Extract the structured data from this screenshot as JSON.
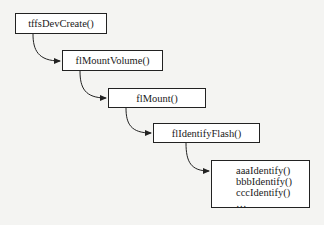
{
  "diagram": {
    "nodes": [
      {
        "id": "n1",
        "label": "tffsDevCreate()"
      },
      {
        "id": "n2",
        "label": "flMountVolume()"
      },
      {
        "id": "n3",
        "label": "flMount()"
      },
      {
        "id": "n4",
        "label": "flIdentifyFlash()"
      },
      {
        "id": "n5",
        "items": [
          "aaaIdentify()",
          "bbbIdentify()",
          "cccIdentify()",
          "…"
        ]
      }
    ],
    "edges": [
      {
        "from": "n1",
        "to": "n2"
      },
      {
        "from": "n2",
        "to": "n3"
      },
      {
        "from": "n3",
        "to": "n4"
      },
      {
        "from": "n4",
        "to": "n5"
      }
    ],
    "colors": {
      "stroke": "#222222",
      "background": "#f4f4f2",
      "box_fill": "#ffffff"
    }
  }
}
